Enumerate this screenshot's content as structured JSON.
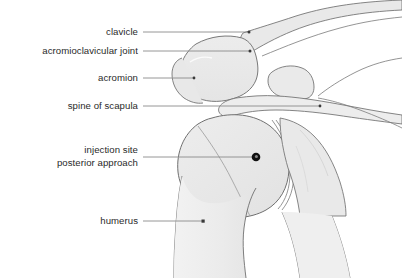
{
  "figure": {
    "background_color": "#ffffff",
    "bone_fill_color": "#ebebeb",
    "bone_outline_color": "#6b6b6b",
    "label_text_color": "#2a2a2a",
    "leader_line_color": "#8a8a8a",
    "marker_color": "#1a1a1a"
  },
  "labels": {
    "clavicle": "clavicle",
    "ac_joint": "acromioclavicular joint",
    "acromion": "acromion",
    "spine_of_scapula": "spine of scapula",
    "injection_site_line1": "injection site",
    "injection_site_line2": "posterior approach",
    "humerus": "humerus"
  },
  "annotations": [
    {
      "id": "clavicle",
      "label": "clavicle",
      "label_right_x": 138,
      "label_baseline_y": 36,
      "leader_from_x": 143,
      "leader_from_y": 32,
      "leader_to_x": 249,
      "leader_to_y": 32,
      "endpoint_marker": "dot"
    },
    {
      "id": "acromioclavicular-joint",
      "label": "acromioclavicular joint",
      "label_right_x": 138,
      "label_baseline_y": 55,
      "leader_from_x": 143,
      "leader_from_y": 51,
      "leader_to_x": 250,
      "leader_to_y": 51,
      "endpoint_marker": "dot"
    },
    {
      "id": "acromion",
      "label": "acromion",
      "label_right_x": 138,
      "label_baseline_y": 82,
      "leader_from_x": 143,
      "leader_from_y": 78,
      "leader_to_x": 194,
      "leader_to_y": 78,
      "endpoint_marker": "dot"
    },
    {
      "id": "spine-of-scapula",
      "label": "spine of scapula",
      "label_right_x": 138,
      "label_baseline_y": 110,
      "leader_from_x": 143,
      "leader_from_y": 106,
      "leader_to_x": 320,
      "leader_to_y": 106,
      "endpoint_marker": "dot"
    },
    {
      "id": "injection-site",
      "label": "injection site posterior approach",
      "label_right_x": 138,
      "label_baseline_y": 155,
      "leader_from_x": 143,
      "leader_from_y": 157,
      "leader_to_x": 252,
      "leader_to_y": 157,
      "endpoint_marker": "ring"
    },
    {
      "id": "humerus",
      "label": "humerus",
      "label_right_x": 138,
      "label_baseline_y": 225,
      "leader_from_x": 143,
      "leader_from_y": 221,
      "leader_to_x": 205,
      "leader_to_y": 221,
      "endpoint_marker": "square"
    }
  ],
  "injection_marker": {
    "center_x": 256,
    "center_y": 157,
    "radius": 4.2,
    "inner_radius": 1.5,
    "color": "#111111",
    "inner_color": "#7d7d7d"
  },
  "anatomy_parts": [
    {
      "name": "clavicle",
      "fill": "#e9e9e9"
    },
    {
      "name": "acromion",
      "fill": "#e7e7e7"
    },
    {
      "name": "coracoid-process",
      "fill": "#eaeaea"
    },
    {
      "name": "scapula-spine",
      "fill": "#ededed"
    },
    {
      "name": "humeral-head",
      "fill": "#e9e9e9"
    },
    {
      "name": "humerus-shaft",
      "fill": "#efefef"
    },
    {
      "name": "glenoid-joint-space",
      "fill": "#f4f4f4"
    }
  ]
}
